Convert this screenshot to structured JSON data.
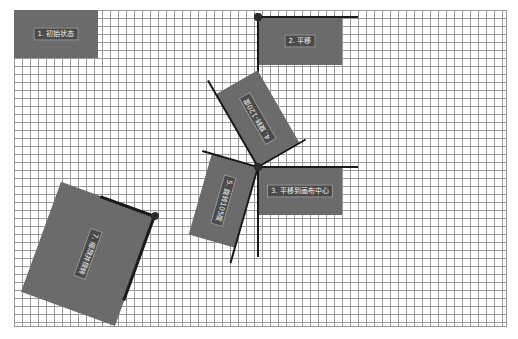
{
  "diagram": {
    "type": "canvas-transform-demo",
    "grid": {
      "spacing_px": 8,
      "line_color": "#9a9a9a"
    },
    "colors": {
      "rect_fill": "#6b6b6b",
      "label_bg": "#4a4a4a",
      "label_text": "#f2f2f2",
      "axis": "#1a1a1a"
    },
    "steps": [
      {
        "id": 1,
        "label": "1. 初始状态"
      },
      {
        "id": 2,
        "label": "2. 平移"
      },
      {
        "id": 3,
        "label": "3. 平移到画布中心"
      },
      {
        "id": 4,
        "label": "4. 旋转-120度"
      },
      {
        "id": 5,
        "label": "5. 旋转105度"
      },
      {
        "id": 7,
        "label": "7. 缩放并旋转"
      }
    ]
  }
}
